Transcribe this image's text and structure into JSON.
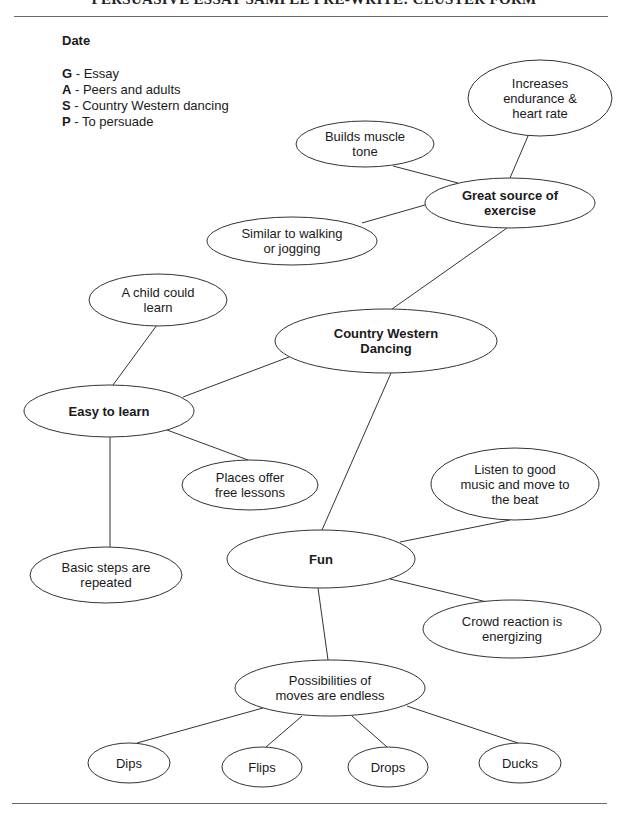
{
  "header": {
    "title": "PERSUASIVE ESSAY SAMPLE PRE-WRITE: CLUSTER FORM"
  },
  "date_label": "Date",
  "gasp": [
    {
      "key": "G",
      "text": " - Essay"
    },
    {
      "key": "A",
      "text": " - Peers and adults"
    },
    {
      "key": "S",
      "text": " - Country Western dancing"
    },
    {
      "key": "P",
      "text": " - To persuade"
    }
  ],
  "nodes": [
    {
      "id": "increases",
      "lines": [
        "Increases",
        "endurance &",
        "heart rate"
      ],
      "bold": false,
      "cx": 540,
      "cy": 98,
      "rx": 72,
      "ry": 38
    },
    {
      "id": "builds",
      "lines": [
        "Builds muscle",
        "tone"
      ],
      "bold": false,
      "cx": 365,
      "cy": 144,
      "rx": 69,
      "ry": 23
    },
    {
      "id": "great",
      "lines": [
        "Great source of",
        "exercise"
      ],
      "bold": true,
      "cx": 510,
      "cy": 203,
      "rx": 85,
      "ry": 25
    },
    {
      "id": "similar",
      "lines": [
        "Similar to walking",
        "or jogging"
      ],
      "bold": false,
      "cx": 292,
      "cy": 241,
      "rx": 85,
      "ry": 24
    },
    {
      "id": "child",
      "lines": [
        "A child could",
        "learn"
      ],
      "bold": false,
      "cx": 158,
      "cy": 300,
      "rx": 69,
      "ry": 26
    },
    {
      "id": "cwd",
      "lines": [
        "Country Western",
        "Dancing"
      ],
      "bold": true,
      "cx": 386,
      "cy": 341,
      "rx": 111,
      "ry": 32
    },
    {
      "id": "easy",
      "lines": [
        "Easy to learn"
      ],
      "bold": true,
      "cx": 109,
      "cy": 411,
      "rx": 85,
      "ry": 26
    },
    {
      "id": "places",
      "lines": [
        "Places offer",
        "free lessons"
      ],
      "bold": false,
      "cx": 250,
      "cy": 485,
      "rx": 68,
      "ry": 25
    },
    {
      "id": "listen",
      "lines": [
        "Listen to good",
        "music and move to",
        "the beat"
      ],
      "bold": false,
      "cx": 515,
      "cy": 484,
      "rx": 84,
      "ry": 36
    },
    {
      "id": "fun",
      "lines": [
        "Fun"
      ],
      "bold": true,
      "cx": 321,
      "cy": 559,
      "rx": 94,
      "ry": 29
    },
    {
      "id": "basic",
      "lines": [
        "Basic steps are",
        "repeated"
      ],
      "bold": false,
      "cx": 106,
      "cy": 575,
      "rx": 76,
      "ry": 28
    },
    {
      "id": "crowd",
      "lines": [
        "Crowd reaction is",
        "energizing"
      ],
      "bold": false,
      "cx": 512,
      "cy": 629,
      "rx": 89,
      "ry": 29
    },
    {
      "id": "possibilities",
      "lines": [
        "Possibilities of",
        "moves are endless"
      ],
      "bold": false,
      "cx": 330,
      "cy": 688,
      "rx": 95,
      "ry": 28
    },
    {
      "id": "dips",
      "lines": [
        "Dips"
      ],
      "bold": false,
      "cx": 129,
      "cy": 763,
      "rx": 41,
      "ry": 20
    },
    {
      "id": "flips",
      "lines": [
        "Flips"
      ],
      "bold": false,
      "cx": 262,
      "cy": 767,
      "rx": 40,
      "ry": 20
    },
    {
      "id": "drops",
      "lines": [
        "Drops"
      ],
      "bold": false,
      "cx": 388,
      "cy": 767,
      "rx": 40,
      "ry": 20
    },
    {
      "id": "ducks",
      "lines": [
        "Ducks"
      ],
      "bold": false,
      "cx": 520,
      "cy": 763,
      "rx": 41,
      "ry": 20
    }
  ],
  "edges": [
    {
      "from": "builds",
      "to": "great",
      "x1": 393,
      "y1": 166,
      "x2": 458,
      "y2": 183
    },
    {
      "from": "increases",
      "to": "great",
      "x1": 528,
      "y1": 136,
      "x2": 510,
      "y2": 178
    },
    {
      "from": "similar",
      "to": "great",
      "x1": 362,
      "y1": 223,
      "x2": 425,
      "y2": 205
    },
    {
      "from": "great",
      "to": "cwd",
      "x1": 507,
      "y1": 228,
      "x2": 392,
      "y2": 309
    },
    {
      "from": "child",
      "to": "easy",
      "x1": 157,
      "y1": 325,
      "x2": 113,
      "y2": 385
    },
    {
      "from": "easy",
      "to": "cwd",
      "x1": 183,
      "y1": 397,
      "x2": 289,
      "y2": 357
    },
    {
      "from": "easy",
      "to": "places",
      "x1": 167,
      "y1": 430,
      "x2": 248,
      "y2": 460
    },
    {
      "from": "easy",
      "to": "basic",
      "x1": 110,
      "y1": 437,
      "x2": 110,
      "y2": 547
    },
    {
      "from": "cwd",
      "to": "fun",
      "x1": 391,
      "y1": 373,
      "x2": 322,
      "y2": 530
    },
    {
      "from": "fun",
      "to": "listen",
      "x1": 400,
      "y1": 542,
      "x2": 510,
      "y2": 520
    },
    {
      "from": "fun",
      "to": "crowd",
      "x1": 390,
      "y1": 579,
      "x2": 487,
      "y2": 602
    },
    {
      "from": "fun",
      "to": "possibilities",
      "x1": 318,
      "y1": 588,
      "x2": 328,
      "y2": 660
    },
    {
      "from": "possibilities",
      "to": "dips",
      "x1": 263,
      "y1": 708,
      "x2": 137,
      "y2": 743
    },
    {
      "from": "possibilities",
      "to": "flips",
      "x1": 302,
      "y1": 716,
      "x2": 266,
      "y2": 747
    },
    {
      "from": "possibilities",
      "to": "drops",
      "x1": 352,
      "y1": 716,
      "x2": 387,
      "y2": 747
    },
    {
      "from": "possibilities",
      "to": "ducks",
      "x1": 407,
      "y1": 706,
      "x2": 518,
      "y2": 743
    }
  ]
}
